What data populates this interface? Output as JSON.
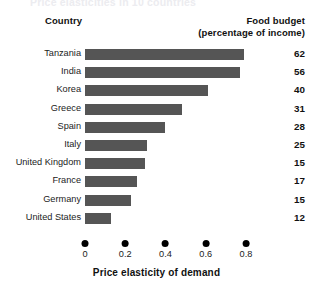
{
  "figure": {
    "title": "Price elasticities in 10 countries"
  },
  "headers": {
    "country": "Country",
    "budget_line1": "Food budget",
    "budget_line2": "(percentage of income)"
  },
  "axis": {
    "title": "Price elasticity of demand",
    "ticks": [
      "0",
      "0.2",
      "0.4",
      "0.6",
      "0.8"
    ]
  },
  "chart_data": {
    "type": "bar",
    "orientation": "horizontal",
    "title": "Price elasticities in 10 countries",
    "xlabel": "Price elasticity of demand",
    "ylabel": "Country",
    "xlim": [
      0,
      0.85
    ],
    "xticks": [
      0,
      0.2,
      0.4,
      0.6,
      0.8
    ],
    "grid": false,
    "legend": "none",
    "bar_color": "#555555",
    "categories": [
      "Tanzania",
      "India",
      "Korea",
      "Greece",
      "Spain",
      "Italy",
      "United Kingdom",
      "France",
      "Germany",
      "United States"
    ],
    "values": [
      0.79,
      0.77,
      0.61,
      0.48,
      0.4,
      0.31,
      0.3,
      0.26,
      0.23,
      0.13
    ],
    "series": [
      {
        "name": "Price elasticity of demand",
        "values": [
          0.79,
          0.77,
          0.61,
          0.48,
          0.4,
          0.31,
          0.3,
          0.26,
          0.23,
          0.13
        ]
      },
      {
        "name": "Food budget (percentage of income)",
        "values": [
          62,
          56,
          40,
          31,
          28,
          25,
          15,
          17,
          15,
          12
        ]
      }
    ],
    "rows": [
      {
        "country": "Tanzania",
        "elasticity": 0.79,
        "food_budget": "62"
      },
      {
        "country": "India",
        "elasticity": 0.77,
        "food_budget": "56"
      },
      {
        "country": "Korea",
        "elasticity": 0.61,
        "food_budget": "40"
      },
      {
        "country": "Greece",
        "elasticity": 0.48,
        "food_budget": "31"
      },
      {
        "country": "Spain",
        "elasticity": 0.4,
        "food_budget": "28"
      },
      {
        "country": "Italy",
        "elasticity": 0.31,
        "food_budget": "25"
      },
      {
        "country": "United Kingdom",
        "elasticity": 0.3,
        "food_budget": "15"
      },
      {
        "country": "France",
        "elasticity": 0.26,
        "food_budget": "17"
      },
      {
        "country": "Germany",
        "elasticity": 0.23,
        "food_budget": "15"
      },
      {
        "country": "United States",
        "elasticity": 0.13,
        "food_budget": "12"
      }
    ]
  }
}
